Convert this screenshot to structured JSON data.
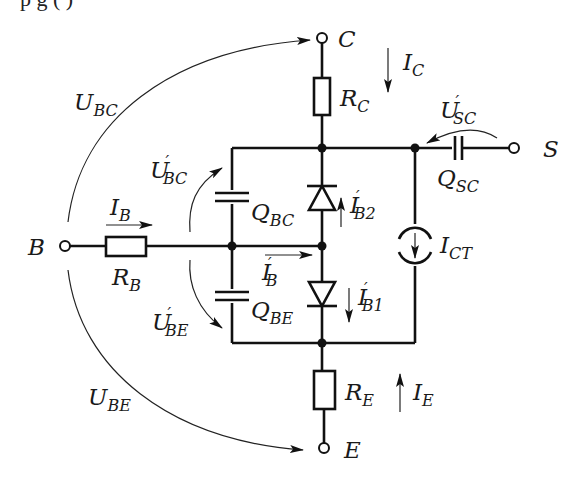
{
  "caption_fragment": "p      g   (      )",
  "terminals": {
    "collector": "C",
    "base": "B",
    "emitter": "E",
    "substrate": "S"
  },
  "components": {
    "R_C": {
      "main": "R",
      "sub": "C"
    },
    "R_B": {
      "main": "R",
      "sub": "B"
    },
    "R_E": {
      "main": "R",
      "sub": "E"
    },
    "Q_BC": {
      "main": "Q",
      "sub": "BC"
    },
    "Q_BE": {
      "main": "Q",
      "sub": "BE"
    },
    "Q_SC": {
      "main": "Q",
      "sub": "SC"
    },
    "I_CT": {
      "main": "I",
      "sub": "CT"
    }
  },
  "currents": {
    "I_C": {
      "main": "I",
      "sub": "C"
    },
    "I_B": {
      "main": "I",
      "sub": "B"
    },
    "I_E": {
      "main": "I",
      "sub": "E"
    },
    "I_B_prime": {
      "main": "I",
      "prime": "′",
      "sub": "B"
    },
    "I_B1_prime": {
      "main": "I",
      "prime": "′",
      "sub": "B1"
    },
    "I_B2_prime": {
      "main": "I",
      "prime": "′",
      "sub": "B2"
    }
  },
  "voltages": {
    "U_BC": {
      "main": "U",
      "sub": "BC"
    },
    "U_BE": {
      "main": "U",
      "sub": "BE"
    },
    "U_BC_prime": {
      "main": "U",
      "prime": "′",
      "sub": "BC"
    },
    "U_BE_prime": {
      "main": "U",
      "prime": "′",
      "sub": "BE"
    },
    "U_SC_prime": {
      "main": "U",
      "prime": "′",
      "sub": "SC"
    }
  }
}
